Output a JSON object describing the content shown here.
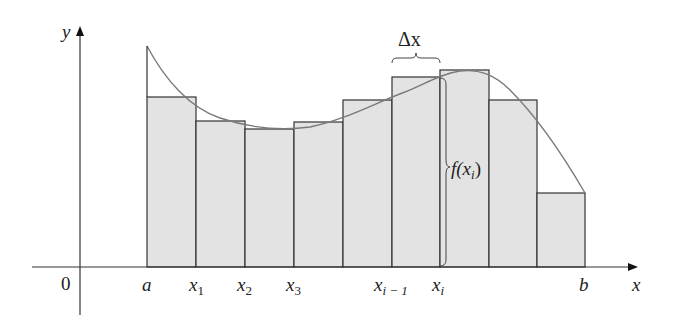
{
  "diagram": {
    "axes": {
      "x_label": "x",
      "y_label": "y",
      "origin_label": "0"
    },
    "tick_labels": [
      {
        "id": "a",
        "text": "a",
        "sub": ""
      },
      {
        "id": "x1",
        "text": "x",
        "sub": "1"
      },
      {
        "id": "x2",
        "text": "x",
        "sub": "2"
      },
      {
        "id": "x3",
        "text": "x",
        "sub": "3"
      },
      {
        "id": "xim1",
        "text": "x",
        "sub": "i − 1"
      },
      {
        "id": "xi",
        "text": "x",
        "sub": "i"
      },
      {
        "id": "b",
        "text": "b",
        "sub": ""
      }
    ],
    "annotations": {
      "delta_x": "Δx",
      "f_of_xi_prefix": "f(x",
      "f_of_xi_sub": "i",
      "f_of_xi_suffix": ")"
    },
    "colors": {
      "rect_fill": "#e3e3e3",
      "rect_stroke": "#333333",
      "curve": "#777777",
      "axis": "#333333"
    },
    "rectangles": [
      {
        "x0": 147,
        "x1": 196,
        "top": 97
      },
      {
        "x0": 196,
        "x1": 245,
        "top": 121
      },
      {
        "x0": 245,
        "x1": 294,
        "top": 129
      },
      {
        "x0": 294,
        "x1": 343,
        "top": 122
      },
      {
        "x0": 343,
        "x1": 392,
        "top": 100
      },
      {
        "x0": 392,
        "x1": 440,
        "top": 77
      },
      {
        "x0": 440,
        "x1": 489,
        "top": 70
      },
      {
        "x0": 489,
        "x1": 537,
        "top": 100
      },
      {
        "x0": 537,
        "x1": 585,
        "top": 193
      }
    ]
  }
}
